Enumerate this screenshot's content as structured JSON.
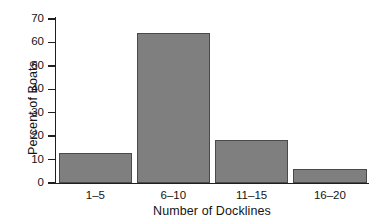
{
  "chart_data": {
    "type": "bar",
    "title": "",
    "categories": [
      "1–5",
      "6–10",
      "11–15",
      "16–20"
    ],
    "values": [
      12.8,
      64,
      18.5,
      6
    ],
    "xlabel": "Number of Docklines",
    "ylabel": "Percent of Boats",
    "ylim": [
      0,
      70
    ],
    "ytick_labels": [
      "0",
      "10",
      "20",
      "30",
      "40",
      "50",
      "60",
      "70"
    ],
    "ytick_values": [
      0,
      10,
      20,
      30,
      40,
      50,
      60,
      70
    ],
    "grid": false,
    "legend": false,
    "bar_color": "#7f7f7f",
    "bar_edge_color": "#4a4a4a",
    "axis_color": "#1f1f1f",
    "background": "#ffffff"
  },
  "axes": {
    "y_title": "Percent of Boats",
    "x_title": "Number of Docklines"
  },
  "ticks": {
    "y": [
      {
        "label": "70",
        "value": 70
      },
      {
        "label": "60",
        "value": 60
      },
      {
        "label": "50",
        "value": 50
      },
      {
        "label": "40",
        "value": 40
      },
      {
        "label": "30",
        "value": 30
      },
      {
        "label": "20",
        "value": 20
      },
      {
        "label": "10",
        "value": 10
      },
      {
        "label": "0",
        "value": 0
      }
    ]
  },
  "bars": [
    {
      "label": "1–5",
      "value": 12.8
    },
    {
      "label": "6–10",
      "value": 64
    },
    {
      "label": "11–15",
      "value": 18.5
    },
    {
      "label": "16–20",
      "value": 6
    }
  ]
}
